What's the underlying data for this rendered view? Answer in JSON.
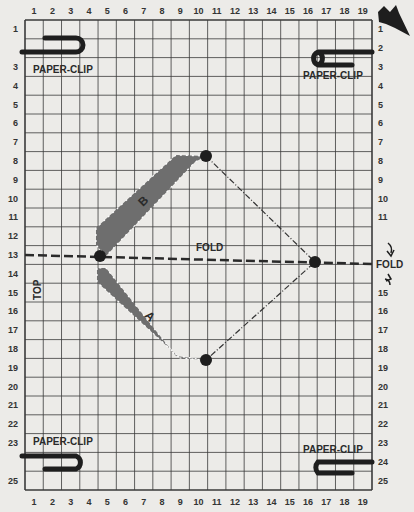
{
  "grid": {
    "columns": 19,
    "rows": 25,
    "column_labels_top": [
      "1",
      "2",
      "3",
      "4",
      "5",
      "6",
      "7",
      "8",
      "9",
      "10",
      "11",
      "12",
      "13",
      "14",
      "15",
      "16",
      "17",
      "18",
      "19"
    ],
    "column_labels_bottom": [
      "1",
      "2",
      "3",
      "4",
      "5",
      "6",
      "7",
      "8",
      "9",
      "10",
      "11",
      "12",
      "13",
      "14",
      "15",
      "16",
      "17",
      "18",
      "19"
    ],
    "row_labels_left": [
      "1",
      "",
      "3",
      "4",
      "5",
      "6",
      "7",
      "8",
      "9",
      "10",
      "11",
      "12",
      "13",
      "14",
      "15",
      "16",
      "17",
      "18",
      "19",
      "20",
      "21",
      "22",
      "23",
      "",
      "25"
    ],
    "row_labels_right": [
      "1",
      "2",
      "3",
      "4",
      "5",
      "6",
      "7",
      "8",
      "9",
      "10",
      "11",
      "",
      "",
      "",
      "15",
      "16",
      "17",
      "18",
      "19",
      "20",
      "21",
      "22",
      "23",
      "24",
      "25"
    ]
  },
  "labels": {
    "paper_clip_top_left": "PAPER-CLIP",
    "paper_clip_top_right": "PAPER-CLIP",
    "paper_clip_bottom_left": "PAPER-CLIP",
    "paper_clip_bottom_right": "PAPER-CLIP",
    "fold_center": "FOLD",
    "fold_right": "FOLD",
    "top": "TOP",
    "band_upper": "B",
    "band_lower": "A"
  },
  "points": [
    {
      "name": "left",
      "col": 4.5,
      "row": 13.2
    },
    {
      "name": "top",
      "col": 10.5,
      "row": 7.5
    },
    {
      "name": "right",
      "col": 16.5,
      "row": 13.5
    },
    {
      "name": "bottom",
      "col": 10.5,
      "row": 18.5
    }
  ],
  "colors": {
    "paper": "#ecebe8",
    "grid_line": "#3a3a3a",
    "band_fill": "#6e6e6e",
    "ink": "#1e1e1e"
  }
}
